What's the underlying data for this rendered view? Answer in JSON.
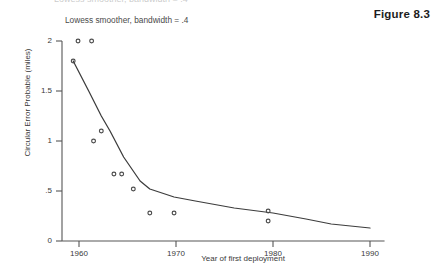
{
  "figure": {
    "label": "Figure 8.3",
    "top_sliver_text": "Lowess smoother, bandwidth = .4"
  },
  "chart_data": {
    "type": "scatter",
    "title": "",
    "subtitle": "Lowess smoother, bandwidth = .4",
    "xlabel": "Year of first deployment",
    "ylabel": "Circular Error Probable (miles)",
    "xlim": [
      1958.2,
      1991.5
    ],
    "ylim": [
      0,
      2.1
    ],
    "xticks": [
      1960,
      1970,
      1980,
      1990
    ],
    "xtick_labels": [
      "1960",
      "1970",
      "1980",
      "1990"
    ],
    "yticks": [
      0,
      0.5,
      1,
      1.5,
      2
    ],
    "ytick_labels": [
      "0",
      ".5",
      "1",
      "1.5",
      "2"
    ],
    "grid": false,
    "legend": false,
    "marker": "open-circle",
    "series": [
      {
        "name": "Circular Error Probable",
        "type": "scatter",
        "x": [
          1959.9,
          1961.3,
          1959.4,
          1962.3,
          1961.5,
          1963.6,
          1964.4,
          1965.6,
          1967.3,
          1969.8,
          1979.5,
          1979.5
        ],
        "y": [
          2.0,
          2.0,
          1.8,
          1.1,
          1.0,
          0.67,
          0.67,
          0.52,
          0.28,
          0.28,
          0.3,
          0.2
        ]
      },
      {
        "name": "Lowess smoother",
        "type": "line",
        "x": [
          1959.4,
          1961.0,
          1962.3,
          1963.2,
          1964.6,
          1966.3,
          1967.3,
          1969.8,
          1972.0,
          1976.0,
          1980.0,
          1983.4,
          1986.0,
          1990.0
        ],
        "y": [
          1.8,
          1.5,
          1.25,
          1.1,
          0.84,
          0.6,
          0.52,
          0.44,
          0.4,
          0.33,
          0.28,
          0.22,
          0.17,
          0.13
        ]
      }
    ],
    "smoother": {
      "method": "lowess",
      "bandwidth": 0.4,
      "knot_x": [
        1959.4,
        1961.0,
        1963.2,
        1967.3,
        1969.8,
        1980.0,
        1983.4,
        1986.0,
        1990.0
      ],
      "knot_y": [
        1.8,
        1.5,
        1.1,
        0.52,
        0.44,
        0.28,
        0.22,
        0.17,
        0.13
      ]
    },
    "colors": {
      "axis": "#4a4a4a",
      "line": "#2e2e2e",
      "marker_stroke": "#3d3d3d",
      "text": "#3a3a3a",
      "background": "#ffffff"
    }
  }
}
